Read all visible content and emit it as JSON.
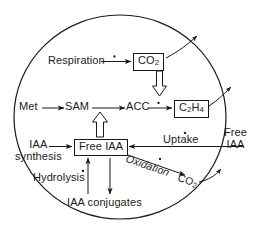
{
  "diagram": {
    "cell_boundary": {
      "shape": "circle",
      "label": "cell-membrane"
    },
    "nodes": {
      "respiration": {
        "text": "Respiration",
        "boxed": false
      },
      "co2_top": {
        "text": "CO",
        "sub": "2",
        "boxed": true
      },
      "met": {
        "text": "Met",
        "boxed": false
      },
      "sam": {
        "text": "SAM",
        "boxed": false
      },
      "acc": {
        "text": "ACC",
        "boxed": false
      },
      "ethylene": {
        "text": "C",
        "sub": "2",
        "text2": "H",
        "sub2": "4",
        "boxed": true
      },
      "iaa_synthesis": {
        "line1": "IAA",
        "line2": "synthesis",
        "boxed": false
      },
      "free_iaa_box": {
        "text": "Free IAA",
        "boxed": true
      },
      "uptake": {
        "text": "Uptake",
        "boxed": false
      },
      "free_iaa_out": {
        "line1": "Free",
        "line2": "IAA",
        "boxed": false
      },
      "oxidation": {
        "text": "Oxidation",
        "boxed": false
      },
      "co2_ox": {
        "text": "CO",
        "sub": "2",
        "boxed": true
      },
      "hydrolysis": {
        "text": "Hydrolysis",
        "boxed": false
      },
      "iaa_conjugates": {
        "text": "IAA conjugates",
        "boxed": false
      }
    },
    "markers": {
      "dot": "•",
      "note": "small dot marks labelled/regulated steps"
    },
    "colors": {
      "stroke": "#1a1a1a",
      "background": "#ffffff",
      "text": "#1a1a1a"
    },
    "arrows": [
      {
        "name": "respiration-to-co2",
        "style": "solid-line",
        "dot": true
      },
      {
        "name": "co2-efflux",
        "style": "solid-line",
        "dot": false
      },
      {
        "name": "co2-to-ethylene-pathway",
        "style": "hollow-block",
        "dot": false
      },
      {
        "name": "met-to-sam",
        "style": "solid-line",
        "dot": false
      },
      {
        "name": "sam-to-acc",
        "style": "solid-line",
        "dot": false
      },
      {
        "name": "acc-to-ethylene",
        "style": "solid-line",
        "dot": true
      },
      {
        "name": "ethylene-efflux",
        "style": "solid-line",
        "dot": false
      },
      {
        "name": "free-iaa-to-acc-pathway",
        "style": "hollow-block",
        "dot": false
      },
      {
        "name": "iaa-synthesis-to-free-iaa",
        "style": "solid-line",
        "dot": false
      },
      {
        "name": "uptake-to-free-iaa",
        "style": "solid-line",
        "dot": true
      },
      {
        "name": "free-iaa-to-oxidation-co2",
        "style": "solid-line",
        "dot": true
      },
      {
        "name": "co2-oxidation-efflux",
        "style": "solid-line",
        "dot": false
      },
      {
        "name": "conjugates-to-free-iaa",
        "style": "solid-line",
        "dot": true
      },
      {
        "name": "free-iaa-to-conjugates",
        "style": "solid-line",
        "dot": false
      }
    ]
  }
}
